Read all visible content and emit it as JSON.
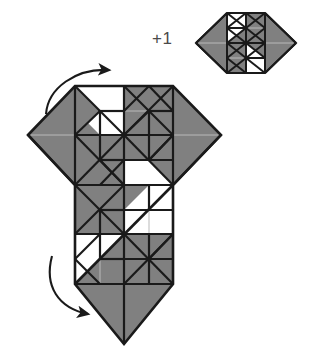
{
  "figure": {
    "type": "origami-fold-step",
    "background_color": "#ffffff",
    "paper_front_color": "#808080",
    "paper_back_color": "#ffffff",
    "crease_color": "#1a1a1a",
    "soft_crease_color": "#b9b9b9",
    "arrow_color": "#1a1a1a"
  },
  "labels": {
    "repeat_label": "+1"
  },
  "reference_model": {
    "name": "small-hexagon-model",
    "position": {
      "x": 196,
      "y": 12
    },
    "size": {
      "width": 100,
      "height": 62
    },
    "description": "Small hexagonal folded unit shown at top right, result of the step"
  },
  "main_model": {
    "name": "main-folded-model",
    "position": {
      "x": 28,
      "y": 83
    },
    "size": {
      "width": 194,
      "height": 262
    },
    "description": "Large folded model with hexagonal upper body and square lower flap ending in a point"
  },
  "arrows": [
    {
      "name": "top-fold-arrow",
      "direction": "clockwise-right",
      "label": "",
      "start": {
        "x": 48,
        "y": 112
      },
      "end": {
        "x": 112,
        "y": 71
      }
    },
    {
      "name": "bottom-fold-arrow",
      "direction": "clockwise-right",
      "label": "",
      "start": {
        "x": 52,
        "y": 258
      },
      "end": {
        "x": 93,
        "y": 314
      }
    }
  ],
  "geometry": {
    "top_hexagon": {
      "left_point": {
        "x": 28,
        "y": 135
      },
      "right_point": {
        "x": 221,
        "y": 135
      },
      "top_left": {
        "x": 75,
        "y": 86
      },
      "top_right": {
        "x": 173,
        "y": 86
      },
      "bottom_left": {
        "x": 75,
        "y": 185
      },
      "bottom_right": {
        "x": 173,
        "y": 185
      }
    },
    "bottom_square": {
      "top_left": {
        "x": 75,
        "y": 185
      },
      "top_right": {
        "x": 173,
        "y": 185
      },
      "bottom_left": {
        "x": 75,
        "y": 284
      },
      "bottom_right": {
        "x": 173,
        "y": 284
      },
      "apex": {
        "x": 124,
        "y": 344
      }
    },
    "grid_divisions": 4
  }
}
